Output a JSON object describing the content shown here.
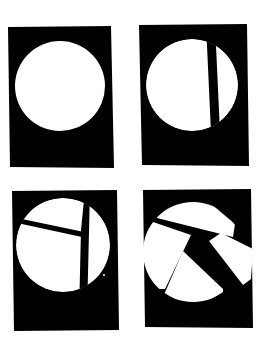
{
  "figure": {
    "colors": {
      "background": "#ffffff",
      "card": "#000000",
      "shape": "#ffffff"
    },
    "panels": [
      {
        "id": 1,
        "label": "whole-circle",
        "pieces": 1
      },
      {
        "id": 2,
        "label": "circle-split-in-two",
        "pieces": 2
      },
      {
        "id": 3,
        "label": "circle-split-in-three",
        "pieces": 3
      },
      {
        "id": 4,
        "label": "circle-fragmented-apart",
        "pieces": 4
      }
    ]
  }
}
